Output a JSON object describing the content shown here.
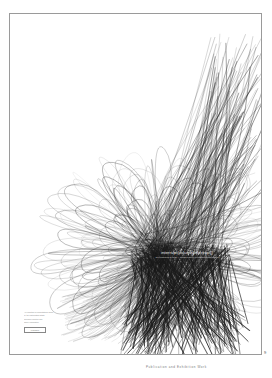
{
  "page": {
    "page_number": "9",
    "caption": "Publication and Exhibition Work"
  },
  "poster": {
    "title": "interrupt(volume[interrupt])",
    "subtitle": "an exhibition of code + image-based works and installations",
    "credits": [
      "An exhibition of computational works",
      "by the participating artists",
      "",
      "Opening reception and",
      "gallery information"
    ],
    "publisher_mark": "Publisher",
    "stroke_color": "#1a1a1a",
    "frame_color": "#9a9a9a"
  }
}
